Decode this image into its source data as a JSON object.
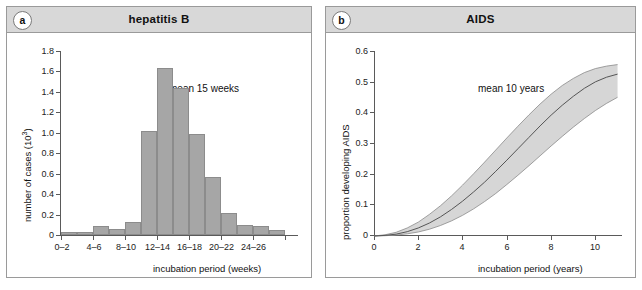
{
  "figure": {
    "panels": [
      {
        "tag": "a",
        "title": "hepatitis B",
        "annotation": "mean 15 weeks"
      },
      {
        "tag": "b",
        "title": "AIDS",
        "annotation": "mean 10 years"
      }
    ]
  },
  "chart_data": [
    {
      "type": "bar",
      "title": "hepatitis B",
      "xlabel": "incubation period (weeks)",
      "ylabel": "number of cases (10³)",
      "annotation": "mean 15 weeks",
      "grid": false,
      "xlim": [
        0,
        28
      ],
      "ylim": [
        0,
        1.8
      ],
      "yticks": [
        0,
        0.2,
        0.4,
        0.6,
        0.8,
        1.0,
        1.2,
        1.4,
        1.6,
        1.8
      ],
      "ytick_labels": [
        "0",
        "0.2",
        "0.4",
        "0.6",
        "0.8",
        "1.0",
        "1.2",
        "1.4",
        "1.6",
        "1.8"
      ],
      "xticks": [
        0,
        2,
        4,
        6,
        8,
        10,
        12,
        14,
        16,
        18,
        20,
        22,
        24,
        26
      ],
      "xtick_labels": [
        "0–2",
        "4–6",
        "8–10",
        "12–14",
        "16–18",
        "20–22",
        "24–26"
      ],
      "categories": [
        "0-2",
        "2-4",
        "4-6",
        "6-8",
        "8-10",
        "10-12",
        "12-14",
        "14-16",
        "16-18",
        "18-20",
        "20-22",
        "22-24",
        "24-26",
        "26-28"
      ],
      "values": [
        0.03,
        0.03,
        0.09,
        0.06,
        0.13,
        1.01,
        1.63,
        1.43,
        0.98,
        0.56,
        0.22,
        0.1,
        0.09,
        0.05
      ]
    },
    {
      "type": "line",
      "title": "AIDS",
      "xlabel": "incubation period (years)",
      "ylabel": "proportion developing AIDS",
      "annotation": "mean 10 years",
      "grid": false,
      "xlim": [
        0,
        11.2
      ],
      "ylim": [
        0,
        0.6
      ],
      "yticks": [
        0,
        0.1,
        0.2,
        0.3,
        0.4,
        0.5,
        0.6
      ],
      "ytick_labels": [
        "0",
        "0.1",
        "0.2",
        "0.3",
        "0.4",
        "0.5",
        "0.6"
      ],
      "xticks": [
        0,
        2,
        4,
        6,
        8,
        10
      ],
      "xtick_labels": [
        "0",
        "2",
        "4",
        "6",
        "8",
        "10"
      ],
      "series": [
        {
          "name": "mean proportion developing AIDS",
          "x": [
            0,
            0.5,
            1,
            1.5,
            2,
            2.5,
            3,
            3.5,
            4,
            4.5,
            5,
            5.5,
            6,
            6.5,
            7,
            7.5,
            8,
            8.5,
            9,
            9.5,
            10,
            10.5,
            11
          ],
          "values": [
            0,
            0.002,
            0.006,
            0.014,
            0.026,
            0.042,
            0.062,
            0.086,
            0.113,
            0.143,
            0.175,
            0.21,
            0.246,
            0.283,
            0.32,
            0.357,
            0.392,
            0.424,
            0.453,
            0.479,
            0.5,
            0.515,
            0.525
          ]
        },
        {
          "name": "upper confidence bound",
          "x": [
            0,
            0.5,
            1,
            1.5,
            2,
            2.5,
            3,
            3.5,
            4,
            4.5,
            5,
            5.5,
            6,
            6.5,
            7,
            7.5,
            8,
            8.5,
            9,
            9.5,
            10,
            10.5,
            11
          ],
          "values": [
            0,
            0.004,
            0.012,
            0.026,
            0.045,
            0.07,
            0.098,
            0.13,
            0.165,
            0.202,
            0.24,
            0.279,
            0.318,
            0.356,
            0.393,
            0.428,
            0.46,
            0.488,
            0.511,
            0.53,
            0.543,
            0.551,
            0.556
          ]
        },
        {
          "name": "lower confidence bound",
          "x": [
            0,
            0.5,
            1,
            1.5,
            2,
            2.5,
            3,
            3.5,
            4,
            4.5,
            5,
            5.5,
            6,
            6.5,
            7,
            7.5,
            8,
            8.5,
            9,
            9.5,
            10,
            10.5,
            11
          ],
          "values": [
            0,
            0.001,
            0.003,
            0.007,
            0.013,
            0.022,
            0.034,
            0.049,
            0.067,
            0.088,
            0.112,
            0.138,
            0.167,
            0.197,
            0.228,
            0.26,
            0.292,
            0.323,
            0.353,
            0.381,
            0.407,
            0.43,
            0.45
          ]
        }
      ]
    }
  ],
  "colors": {
    "bar_fill": "#a6a6a6",
    "bar_stroke": "#8c8c8c",
    "header_bg": "#d8d8d8",
    "border": "#9a9a9a",
    "axis": "#5a5a5a",
    "band_fill": "#d3d3d3",
    "line": "#6e6e6e"
  }
}
